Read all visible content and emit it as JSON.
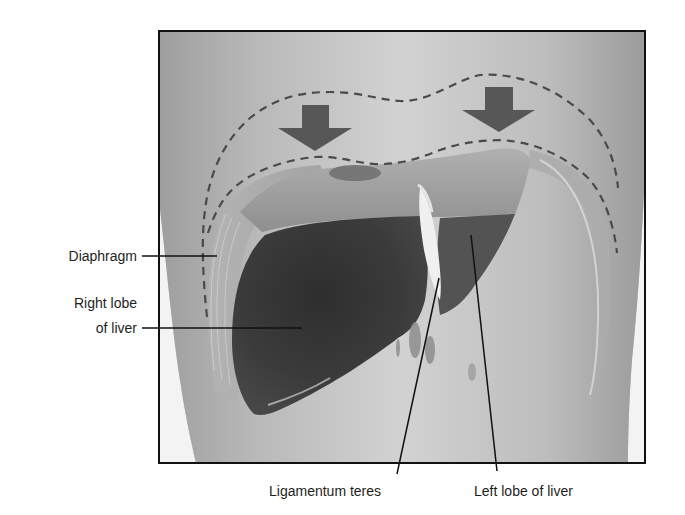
{
  "figure": {
    "colors": {
      "frame": "#111111",
      "background_panel": "#c9c9c9",
      "body_skin": "#bdbdbd",
      "diaphragm_muscle": "#a9a9a9",
      "right_lobe": "#3a3a3a",
      "left_lobe": "#555555",
      "liver_upper_surface": "#9a9a9a",
      "ligamentum_teres": "#efefef",
      "arrows": "#555555",
      "dashed_outline": "#4a4a4a",
      "leader_lines": "#111111"
    },
    "arrows": [
      {
        "name": "left-downward-arrow",
        "direction": "down"
      },
      {
        "name": "right-downward-arrow",
        "direction": "down"
      }
    ],
    "dashed_outlines": [
      {
        "name": "diaphragm-inspiration-outline",
        "style": "dashed"
      },
      {
        "name": "diaphragm-expiration-outline",
        "style": "dashed"
      }
    ]
  },
  "labels": {
    "diaphragm": "Diaphragm",
    "right_lobe_line1": "Right lobe",
    "right_lobe_line2": "of liver",
    "ligamentum_teres": "Ligamentum teres",
    "left_lobe": "Left lobe of liver"
  }
}
